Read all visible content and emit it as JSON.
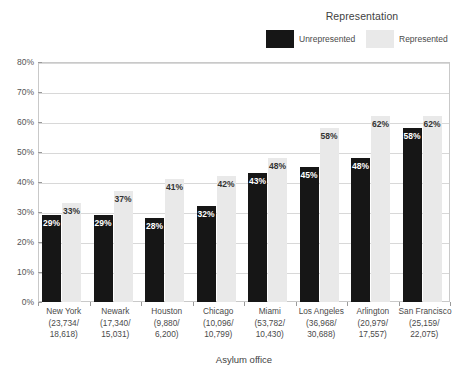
{
  "chart_data": {
    "type": "bar",
    "title": "",
    "xlabel": "Asylum office",
    "ylabel": "",
    "ylim": [
      0,
      80
    ],
    "ytick_labels": [
      "0%",
      "10%",
      "20%",
      "30%",
      "40%",
      "50%",
      "60%",
      "70%",
      "80%"
    ],
    "ytick_values": [
      0,
      10,
      20,
      30,
      40,
      50,
      60,
      70,
      80
    ],
    "grid": true,
    "legend_position": "top-right",
    "legend_title": "Representation",
    "categories": [
      "New York",
      "Newark",
      "Houston",
      "Chicago",
      "Miami",
      "Los Angeles",
      "Arlington",
      "San Francisco"
    ],
    "category_sublabels": [
      [
        "(23,734/",
        "18,618)"
      ],
      [
        "(17,340/",
        "15,031)"
      ],
      [
        "(9,880/",
        "6,200)"
      ],
      [
        "(10,096/",
        "10,799)"
      ],
      [
        "(53,782/",
        "10,430)"
      ],
      [
        "(36,968/",
        "30,688)"
      ],
      [
        "(20,979/",
        "17,557)"
      ],
      [
        "(25,159/",
        "22,075)"
      ]
    ],
    "series": [
      {
        "name": "Unrepresented",
        "color": "#161616",
        "values": [
          29,
          29,
          28,
          32,
          43,
          45,
          48,
          58
        ],
        "labels": [
          "29%",
          "29%",
          "28%",
          "32%",
          "43%",
          "45%",
          "48%",
          "58%"
        ]
      },
      {
        "name": "Represented",
        "color": "#e9e9e9",
        "values": [
          33,
          37,
          41,
          42,
          48,
          58,
          62,
          62
        ],
        "labels": [
          "33%",
          "37%",
          "41%",
          "42%",
          "48%",
          "58%",
          "62%",
          "62%"
        ]
      }
    ]
  },
  "legend": {
    "title": "Representation",
    "entries": [
      {
        "label": "Unrepresented",
        "color": "#161616"
      },
      {
        "label": "Represented",
        "color": "#e9e9e9"
      }
    ]
  },
  "axes": {
    "x_title": "Asylum office"
  }
}
